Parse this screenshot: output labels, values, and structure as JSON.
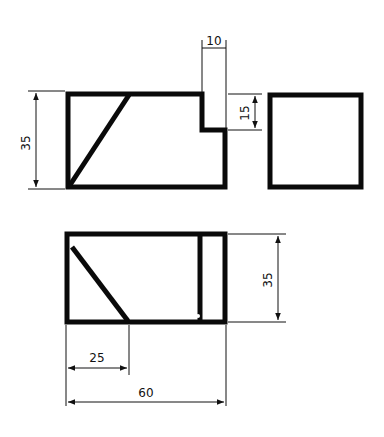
{
  "drawing": {
    "type": "orthographic-projection",
    "views": [
      "front-elevation",
      "side-view",
      "plan-view"
    ],
    "stroke_color": "#0a0a0a",
    "background": "#ffffff"
  },
  "dimensions": {
    "front_height": "35",
    "notch_width": "10",
    "notch_height": "15",
    "plan_depth": "35",
    "plan_partial_width": "25",
    "overall_width": "60"
  }
}
